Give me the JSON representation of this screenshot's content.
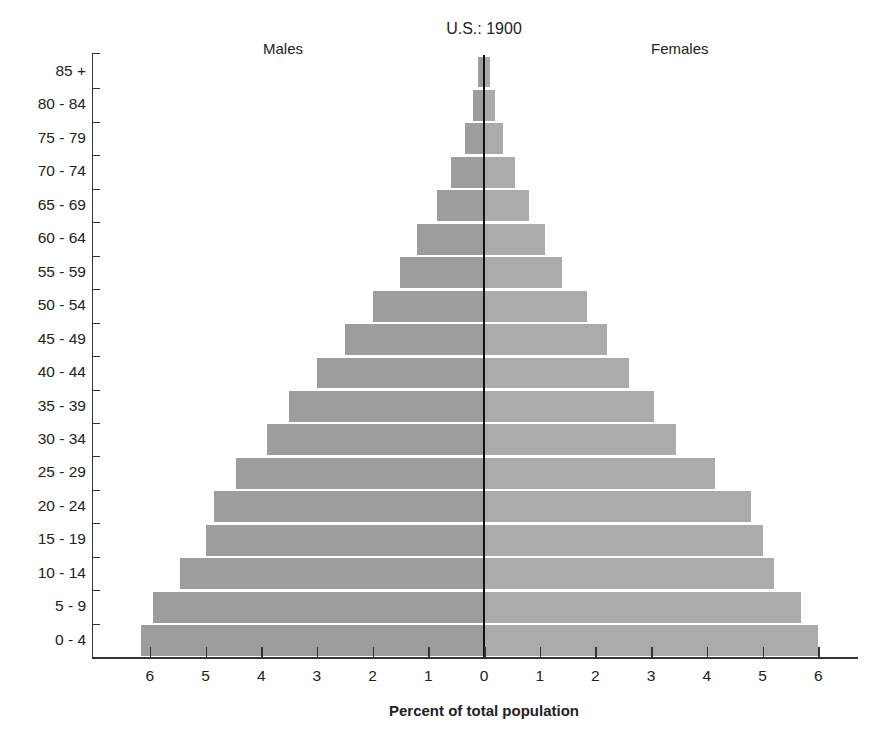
{
  "chart_data": {
    "type": "bar",
    "subtype": "population-pyramid",
    "title": "U.S.: 1900",
    "xlabel": "Percent of total population",
    "ylabel": "",
    "categories": [
      "85 +",
      "80 - 84",
      "75 - 79",
      "70 - 74",
      "65 - 69",
      "60 - 64",
      "55 - 59",
      "50 - 54",
      "45 - 49",
      "40 - 44",
      "35 - 39",
      "30 - 34",
      "25 - 29",
      "20 - 24",
      "15 - 19",
      "10 - 14",
      "5 - 9",
      "0 - 4"
    ],
    "series": [
      {
        "name": "Males",
        "side": "left",
        "values": [
          0.1,
          0.2,
          0.35,
          0.6,
          0.85,
          1.2,
          1.5,
          2.0,
          2.5,
          3.0,
          3.5,
          3.9,
          4.45,
          4.85,
          5.0,
          5.45,
          5.95,
          6.15
        ]
      },
      {
        "name": "Females",
        "side": "right",
        "values": [
          0.1,
          0.2,
          0.35,
          0.55,
          0.8,
          1.1,
          1.4,
          1.85,
          2.2,
          2.6,
          3.05,
          3.45,
          4.15,
          4.8,
          5.0,
          5.2,
          5.7,
          6.0
        ]
      }
    ],
    "xticks_left": [
      "6",
      "5",
      "4",
      "3",
      "2",
      "1",
      "0"
    ],
    "xticks_right": [
      "1",
      "2",
      "3",
      "4",
      "5",
      "6"
    ],
    "xlim": [
      -6.5,
      6.8
    ],
    "grid": false,
    "legend": "inline labels: Males (left), Females (right)"
  },
  "labels": {
    "title": "U.S.: 1900",
    "males": "Males",
    "females": "Females",
    "xtitle": "Percent of total population"
  },
  "colors": {
    "bar_male": "#9d9d9d",
    "bar_female": "#ababab",
    "axis": "#333333"
  }
}
